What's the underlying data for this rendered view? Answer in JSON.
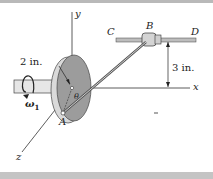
{
  "figure": {
    "labels": {
      "y_axis": "y",
      "x_axis": "x",
      "z_axis": "z",
      "point_b": "B",
      "point_c": "C",
      "point_d": "D",
      "point_a": "A",
      "point_o": "O",
      "angle": "θ",
      "radius_dim": "2 in.",
      "height_dim": "3 in.",
      "omega": "ω",
      "omega_sub": "1"
    },
    "colors": {
      "disk_face": "#9a9a9a",
      "disk_rim": "#d8d8d8",
      "shaft": "#e4e4e4",
      "rod": "#b0b0b0",
      "line": "#333333",
      "frame": "#b9b9b9"
    }
  }
}
